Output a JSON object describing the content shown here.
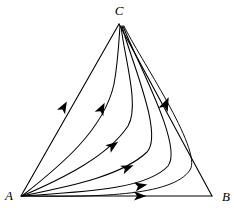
{
  "figure": {
    "background_color": "#ffffff",
    "stroke_color": "#000000",
    "width": 234,
    "height": 214
  },
  "vertices": [
    {
      "id": "A",
      "label": "A",
      "x": 21,
      "y": 196,
      "label_x": 9,
      "label_y": 197,
      "role": "source"
    },
    {
      "id": "B",
      "label": "B",
      "x": 212,
      "y": 196,
      "label_x": 226,
      "label_y": 198,
      "role": "saddle"
    },
    {
      "id": "C",
      "label": "C",
      "x": 119,
      "y": 24,
      "label_x": 119,
      "label_y": 12,
      "role": "sink"
    }
  ],
  "edges": [
    {
      "id": "AC",
      "from": "A",
      "to": "C",
      "style": "straight",
      "has_arrow": true
    },
    {
      "id": "AB",
      "from": "A",
      "to": "B",
      "style": "straight",
      "has_arrow": true
    },
    {
      "id": "CB",
      "from": "C",
      "to": "B",
      "style": "straight",
      "has_arrow": false
    }
  ],
  "trajectories": [
    {
      "id": "t1",
      "from": "A",
      "to": "C",
      "description": "left boundary edge, straight",
      "arrow_t": 0.47
    },
    {
      "id": "t2",
      "from": "A",
      "to": "C",
      "description": "inner curve bowing right",
      "arrow_t": 0.46
    },
    {
      "id": "t3",
      "from": "A",
      "to": "C",
      "description": "curve rising steeply after mid-bend",
      "arrow_t": 0.4
    },
    {
      "id": "t4",
      "from": "A",
      "to": "C",
      "description": "curve bending near lower middle",
      "arrow_t": 0.36
    },
    {
      "id": "t5",
      "from": "A",
      "to": "C",
      "description": "curve running low then turning up",
      "arrow_t": 0.33
    },
    {
      "id": "t6",
      "from": "A",
      "to": "C",
      "description": "near-bottom curve turning up close to B",
      "arrow_t": 0.31
    },
    {
      "id": "t7",
      "from": "A",
      "to": "B",
      "description": "bottom boundary edge, straight",
      "arrow_t": 0.62
    }
  ],
  "arrows": [
    {
      "id": "a1",
      "on": "t1",
      "x": 61,
      "y": 112,
      "angle_deg": -61,
      "note": "along A to C left edge"
    },
    {
      "id": "a2",
      "on": "t2",
      "x": 97,
      "y": 112,
      "angle_deg": -63,
      "note": "inner curve toward C"
    },
    {
      "id": "a3",
      "on": "t6",
      "x": 166,
      "y": 104,
      "angle_deg": -67,
      "note": "right bundle toward C"
    },
    {
      "id": "a4",
      "on": "t3",
      "x": 108,
      "y": 148,
      "angle_deg": -36,
      "note": "mid-lower curve"
    },
    {
      "id": "a5",
      "on": "t4",
      "x": 122,
      "y": 169,
      "angle_deg": -22,
      "note": "lower curve"
    },
    {
      "id": "a6",
      "on": "t5",
      "x": 137,
      "y": 188,
      "angle_deg": -11,
      "note": "near-bottom curve"
    },
    {
      "id": "a7",
      "on": "t7",
      "x": 140,
      "y": 196,
      "angle_deg": 0,
      "note": "bottom edge A to B"
    }
  ],
  "flow": {
    "source_vertex": "A",
    "sink_vertex": "C",
    "saddle_vertex": "B",
    "direction_note": "All orbits emanate from A and converge on C; B is a saddle on the boundary."
  }
}
